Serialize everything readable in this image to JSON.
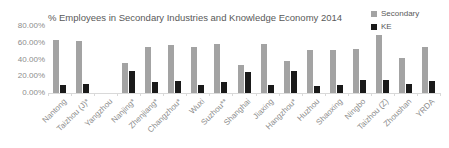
{
  "chart_data": {
    "type": "bar",
    "title": "% Employees in Secondary Industries and Knowledge Economy 2014",
    "categories": [
      "Nantong",
      "Taizhou (J)*",
      "Yangzhou",
      "Nanjing*",
      "Zhenjiang*",
      "Changzhou*",
      "Wuxi",
      "Suzhou**",
      "Shanghai",
      "Jiaxing",
      "Hangzhou*",
      "Huzhou",
      "Shaoxing",
      "Ningbo",
      "Taizhou (Z)",
      "Zhoushan",
      "YRDA"
    ],
    "series": [
      {
        "name": "Secondary",
        "color": "#a3a3a3",
        "values": [
          63,
          62,
          0,
          36,
          55,
          57,
          55,
          59,
          34,
          58,
          38,
          51,
          51,
          53,
          69,
          42,
          55
        ]
      },
      {
        "name": "KE",
        "color": "#1a1a1a",
        "values": [
          9,
          11,
          0,
          26,
          13,
          14,
          10,
          13,
          25,
          9,
          26,
          8,
          10,
          15,
          16,
          11,
          14
        ]
      }
    ],
    "ylabel": "",
    "xlabel": "",
    "ylim": [
      0,
      80
    ],
    "ytick_step": 20,
    "ytick_labels": [
      "0.00%",
      "20.00%",
      "40.00%",
      "60.00%",
      "80.00%"
    ],
    "grid": false,
    "legend_position": "top-right"
  },
  "legend": {
    "items": [
      {
        "label": "Secondary",
        "color": "#a3a3a3"
      },
      {
        "label": "KE",
        "color": "#1a1a1a"
      }
    ]
  },
  "colors": {
    "background": "#ffffff",
    "axis_text": "#8c8c8c",
    "title_text": "#595959",
    "axis_line": "#d9d9d9"
  }
}
